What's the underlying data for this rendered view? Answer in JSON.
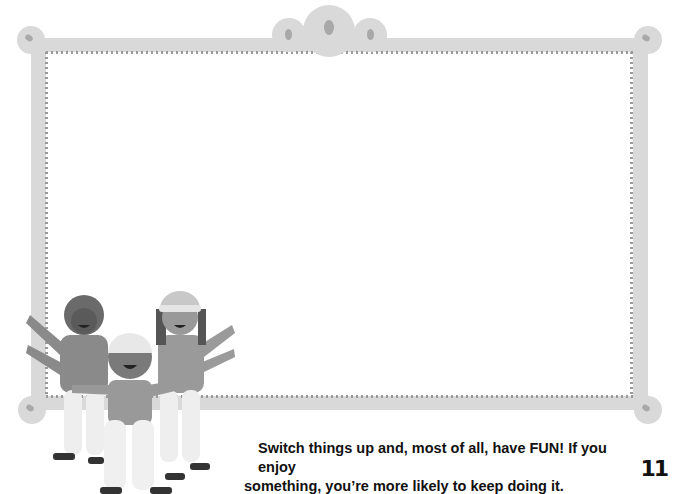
{
  "page": {
    "caption_line1": "Switch things up and, most of all, have FUN! If you enjoy",
    "caption_line2": "something, you’re more likely to keep doing it.",
    "page_number": "11"
  },
  "illustration": {
    "frame": "decorative-picture-frame",
    "figures": [
      "child-dark-hair",
      "child-white-cap",
      "child-knit-hat"
    ]
  },
  "colors": {
    "frame": "#d9d9d9",
    "frame_dots": "#a8a8a8",
    "text": "#111111"
  }
}
